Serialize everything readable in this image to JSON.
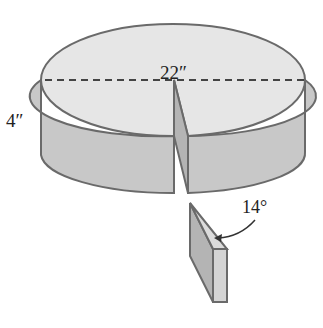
{
  "diagram": {
    "labels": {
      "diameter": "22″",
      "height": "4″",
      "angle": "14°"
    },
    "colors": {
      "top_face": "#e6e6e6",
      "side_face": "#c8c8c8",
      "cut_face": "#b4b4b4",
      "outline": "#6a6a6a",
      "dashed_line": "#444444"
    },
    "components": [
      "cylinder-top-face",
      "cylinder-side",
      "diameter-dashed-line",
      "wedge-gap",
      "removed-wedge-piece",
      "angle-arrow"
    ]
  }
}
